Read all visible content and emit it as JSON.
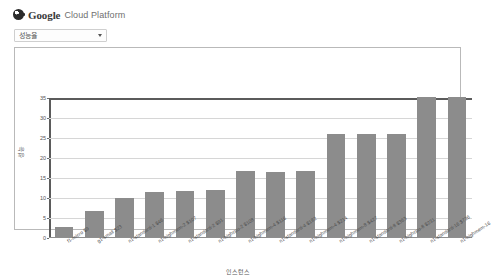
{
  "header": {
    "brand_primary": "Google",
    "brand_secondary": "Cloud Platform",
    "logo_icon": "google-cloud-logo-icon"
  },
  "filter": {
    "selected_value": "성능율",
    "caret_icon": "chevron-down-icon"
  },
  "chart_data": {
    "type": "bar",
    "title": "",
    "xlabel": "인스턴스",
    "ylabel": "성능",
    "ylim": [
      0,
      35
    ],
    "yticks": [
      0,
      5,
      10,
      15,
      20,
      25,
      30,
      35
    ],
    "grid": true,
    "legend": "none",
    "bar_color": "#8c8c8c",
    "categories": [
      "f1-micro $9",
      "g1-small $23",
      "n1-standard-1 $46",
      "n1-highmem-2 $107",
      "n1-standard-2 $91",
      "n1-highcpu-2 $108",
      "n1-highmem-4 $116",
      "n1-standard-4 $182",
      "n1-highmem-4 $214",
      "n1-highmem-8 $427",
      "n1-standard-8 $363",
      "n1-highcpu-8 $231",
      "n1-standard-16 $726",
      "n1-highmem-16"
    ],
    "values": [
      2.4,
      6.6,
      9.7,
      11.3,
      11.4,
      11.7,
      16.4,
      16.3,
      16.5,
      25.8,
      25.8,
      25.8,
      35.0,
      35.4
    ]
  }
}
